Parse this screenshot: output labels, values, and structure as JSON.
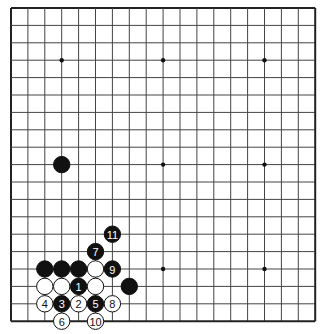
{
  "board": {
    "size": 19,
    "origin_x": 11,
    "origin_y": 8,
    "spacing_x": 16.9,
    "spacing_y": 17.4,
    "line_color": "#444444",
    "border_color": "#222222",
    "star_points": [
      [
        3,
        3
      ],
      [
        9,
        3
      ],
      [
        15,
        3
      ],
      [
        3,
        9
      ],
      [
        9,
        9
      ],
      [
        15,
        9
      ],
      [
        3,
        15
      ],
      [
        9,
        15
      ],
      [
        15,
        15
      ]
    ]
  },
  "stones": [
    {
      "col": 3,
      "row": 9,
      "color": "black",
      "label": ""
    },
    {
      "col": 2,
      "row": 15,
      "color": "black",
      "label": ""
    },
    {
      "col": 3,
      "row": 15,
      "color": "black",
      "label": ""
    },
    {
      "col": 4,
      "row": 15,
      "color": "black",
      "label": ""
    },
    {
      "col": 5,
      "row": 15,
      "color": "white",
      "label": ""
    },
    {
      "col": 6,
      "row": 15,
      "color": "black",
      "label": "9"
    },
    {
      "col": 2,
      "row": 16,
      "color": "white",
      "label": ""
    },
    {
      "col": 3,
      "row": 16,
      "color": "white",
      "label": ""
    },
    {
      "col": 4,
      "row": 16,
      "color": "black",
      "label": "1"
    },
    {
      "col": 5,
      "row": 16,
      "color": "white",
      "label": ""
    },
    {
      "col": 7,
      "row": 16,
      "color": "black",
      "label": ""
    },
    {
      "col": 2,
      "row": 17,
      "color": "white",
      "label": "4"
    },
    {
      "col": 3,
      "row": 17,
      "color": "black",
      "label": "3"
    },
    {
      "col": 4,
      "row": 17,
      "color": "white",
      "label": "2"
    },
    {
      "col": 5,
      "row": 17,
      "color": "black",
      "label": "5"
    },
    {
      "col": 6,
      "row": 17,
      "color": "white",
      "label": "8"
    },
    {
      "col": 3,
      "row": 18,
      "color": "white",
      "label": "6"
    },
    {
      "col": 5,
      "row": 18,
      "color": "white",
      "label": "10"
    },
    {
      "col": 5,
      "row": 14,
      "color": "black",
      "label": "7"
    },
    {
      "col": 6,
      "row": 13,
      "color": "black",
      "label": "11"
    }
  ]
}
